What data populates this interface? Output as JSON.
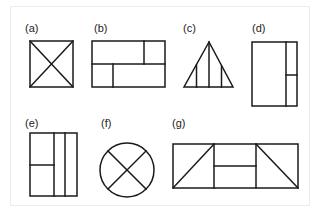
{
  "figures": [
    {
      "id": "a",
      "label": "(a)",
      "shape": "square-with-diagonals"
    },
    {
      "id": "b",
      "label": "(b)",
      "shape": "rectangle-split-into-four-cells"
    },
    {
      "id": "c",
      "label": "(c)",
      "shape": "triangle-with-three-verticals"
    },
    {
      "id": "d",
      "label": "(d)",
      "shape": "tall-rectangle-with-right-column-split"
    },
    {
      "id": "e",
      "label": "(e)",
      "shape": "tall-rectangle-three-columns-left-split"
    },
    {
      "id": "f",
      "label": "(f)",
      "shape": "circle-with-cross-diagonals"
    },
    {
      "id": "g",
      "label": "(g)",
      "shape": "wide-rectangle-three-sections-with-diagonals"
    }
  ],
  "colors": {
    "stroke": "#1a1a1a",
    "background": "#ffffff",
    "frame": "#ececec"
  }
}
